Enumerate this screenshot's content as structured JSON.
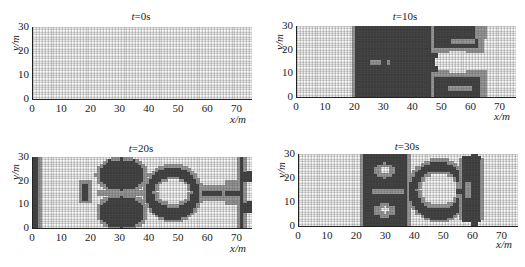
{
  "figure": {
    "colors": {
      "dense": "#3b3b3b",
      "boundary": "#9c9c9c",
      "empty": "#ffffff",
      "grid": "#555555",
      "axis": "#222222"
    }
  },
  "chart_data": [
    {
      "type": "heatmap",
      "title": "t=0s",
      "title_var": "t",
      "title_val": "=0s",
      "xlabel": "x/m",
      "ylabel": "y/m",
      "xlim": [
        0,
        75
      ],
      "ylim": [
        0,
        30
      ],
      "xticks": [
        0,
        10,
        20,
        30,
        40,
        50,
        60,
        70
      ],
      "yticks": [
        0,
        10,
        20,
        30
      ],
      "grid": true,
      "cell_size_m": 1,
      "regions": []
    },
    {
      "type": "heatmap",
      "title": "t=10s",
      "title_var": "t",
      "title_val": "=10s",
      "xlabel": "x/m",
      "ylabel": "y/m",
      "xlim": [
        0,
        75
      ],
      "ylim": [
        0,
        30
      ],
      "xticks": [
        0,
        10,
        20,
        30,
        40,
        50,
        60,
        70
      ],
      "yticks": [
        0,
        10,
        20,
        30
      ],
      "grid": true,
      "cell_size_m": 1,
      "regions": [
        {
          "shape": "rect",
          "x0": 19,
          "x1": 48,
          "y0": 0,
          "y1": 30,
          "level": "boundary"
        },
        {
          "shape": "rect",
          "x0": 20,
          "x1": 48,
          "y0": 0,
          "y1": 30,
          "level": "dense"
        },
        {
          "shape": "rect",
          "x0": 46,
          "x1": 64,
          "y0": 19,
          "y1": 30,
          "level": "boundary"
        },
        {
          "shape": "rect",
          "x0": 47,
          "x1": 62,
          "y0": 21,
          "y1": 30,
          "level": "dense"
        },
        {
          "shape": "rect",
          "x0": 46,
          "x1": 65,
          "y0": 0,
          "y1": 11,
          "level": "boundary"
        },
        {
          "shape": "rect",
          "x0": 47,
          "x1": 63,
          "y0": 0,
          "y1": 9,
          "level": "dense"
        },
        {
          "shape": "ellipse",
          "cx": 57,
          "cy": 24,
          "rx": 5,
          "ry": 1,
          "level": "boundary"
        },
        {
          "shape": "ellipse",
          "cx": 56,
          "cy": 4,
          "rx": 5,
          "ry": 1,
          "level": "boundary"
        },
        {
          "shape": "rect",
          "x0": 25,
          "x1": 29,
          "y0": 14,
          "y1": 16,
          "level": "boundary"
        },
        {
          "shape": "rect",
          "x0": 31,
          "x1": 32,
          "y0": 14,
          "y1": 16,
          "level": "boundary"
        },
        {
          "shape": "rect",
          "x0": 61,
          "x1": 65,
          "y0": 25,
          "y1": 30,
          "level": "boundary"
        },
        {
          "shape": "ellipse",
          "cx": 55,
          "cy": 15,
          "rx": 8,
          "ry": 5,
          "level": "empty"
        }
      ]
    },
    {
      "type": "heatmap",
      "title": "t=20s",
      "title_var": "t",
      "title_val": "=20s",
      "xlabel": "x/m",
      "ylabel": "y/m",
      "xlim": [
        0,
        75
      ],
      "ylim": [
        0,
        30
      ],
      "xticks": [
        0,
        10,
        20,
        30,
        40,
        50,
        60,
        70
      ],
      "yticks": [
        0,
        10,
        20,
        30
      ],
      "grid": true,
      "cell_size_m": 1,
      "regions": [
        {
          "shape": "rect",
          "x0": 0,
          "x1": 3,
          "y0": 0,
          "y1": 30,
          "level": "boundary"
        },
        {
          "shape": "rect",
          "x0": 0,
          "x1": 2,
          "y0": 0,
          "y1": 30,
          "level": "dense"
        },
        {
          "shape": "rect",
          "x0": 16,
          "x1": 20,
          "y0": 11,
          "y1": 20,
          "level": "boundary"
        },
        {
          "shape": "rect",
          "x0": 17,
          "x1": 19,
          "y0": 12,
          "y1": 19,
          "level": "dense"
        },
        {
          "shape": "ellipse",
          "cx": 30.5,
          "cy": 22.5,
          "rx": 9,
          "ry": 7.5,
          "level": "boundary"
        },
        {
          "shape": "ellipse",
          "cx": 30.5,
          "cy": 23,
          "rx": 8,
          "ry": 6.5,
          "level": "dense"
        },
        {
          "shape": "ellipse",
          "cx": 30.5,
          "cy": 7,
          "rx": 9,
          "ry": 7.5,
          "level": "boundary"
        },
        {
          "shape": "ellipse",
          "cx": 30.5,
          "cy": 7,
          "rx": 8,
          "ry": 6.5,
          "level": "dense"
        },
        {
          "shape": "rect",
          "x0": 22,
          "x1": 38,
          "y0": 14,
          "y1": 16,
          "level": "boundary"
        },
        {
          "shape": "ellipse",
          "cx": 48,
          "cy": 15,
          "rx": 10,
          "ry": 12,
          "level": "boundary"
        },
        {
          "shape": "ellipse",
          "cx": 48,
          "cy": 15,
          "rx": 9,
          "ry": 11,
          "level": "dense"
        },
        {
          "shape": "ellipse",
          "cx": 48,
          "cy": 15.5,
          "rx": 6.5,
          "ry": 6.5,
          "level": "boundary"
        },
        {
          "shape": "ellipse",
          "cx": 48,
          "cy": 15.5,
          "rx": 5.5,
          "ry": 5.5,
          "level": "empty"
        },
        {
          "shape": "rect",
          "x0": 58,
          "x1": 66,
          "y0": 12,
          "y1": 18,
          "level": "boundary"
        },
        {
          "shape": "rect",
          "x0": 58,
          "x1": 65,
          "y0": 14,
          "y1": 16,
          "level": "dense"
        },
        {
          "shape": "rect",
          "x0": 66,
          "x1": 71,
          "y0": 10,
          "y1": 20,
          "level": "boundary"
        },
        {
          "shape": "rect",
          "x0": 70,
          "x1": 73,
          "y0": 0,
          "y1": 30,
          "level": "boundary"
        },
        {
          "shape": "rect",
          "x0": 71,
          "x1": 72,
          "y0": 0,
          "y1": 30,
          "level": "dense"
        },
        {
          "shape": "rect",
          "x0": 72,
          "x1": 75,
          "y0": 20,
          "y1": 24,
          "level": "dense"
        },
        {
          "shape": "rect",
          "x0": 72,
          "x1": 75,
          "y0": 7,
          "y1": 11,
          "level": "dense"
        },
        {
          "shape": "rect",
          "x0": 66,
          "x1": 71,
          "y0": 14,
          "y1": 16,
          "level": "dense"
        }
      ]
    },
    {
      "type": "heatmap",
      "title": "t=30s",
      "title_var": "t",
      "title_val": "=30s",
      "xlabel": "x/m",
      "ylabel": "y/m",
      "xlim": [
        0,
        75
      ],
      "ylim": [
        0,
        30
      ],
      "xticks": [
        0,
        10,
        20,
        30,
        40,
        50,
        60,
        70
      ],
      "yticks": [
        0,
        10,
        20,
        30
      ],
      "grid": true,
      "cell_size_m": 1,
      "regions": [
        {
          "shape": "rect",
          "x0": 21,
          "x1": 38,
          "y0": 0,
          "y1": 30,
          "level": "boundary"
        },
        {
          "shape": "rect",
          "x0": 22,
          "x1": 37,
          "y0": 0,
          "y1": 30,
          "level": "dense"
        },
        {
          "shape": "ellipse",
          "cx": 29.5,
          "cy": 23.5,
          "rx": 3.5,
          "ry": 3,
          "level": "boundary"
        },
        {
          "shape": "ellipse",
          "cx": 29.5,
          "cy": 23.5,
          "rx": 2,
          "ry": 1.5,
          "level": "empty"
        },
        {
          "shape": "ellipse",
          "cx": 29.5,
          "cy": 7,
          "rx": 3.5,
          "ry": 3,
          "level": "boundary"
        },
        {
          "shape": "ellipse",
          "cx": 29.5,
          "cy": 7,
          "rx": 2,
          "ry": 1.5,
          "level": "empty"
        },
        {
          "shape": "rect",
          "x0": 25,
          "x1": 36,
          "y0": 14,
          "y1": 16,
          "level": "boundary"
        },
        {
          "shape": "ellipse",
          "cx": 48,
          "cy": 15,
          "rx": 11,
          "ry": 13,
          "level": "boundary"
        },
        {
          "shape": "ellipse",
          "cx": 48,
          "cy": 15,
          "rx": 10,
          "ry": 12,
          "level": "dense"
        },
        {
          "shape": "ellipse",
          "cx": 48,
          "cy": 15.5,
          "rx": 7.5,
          "ry": 8,
          "level": "boundary"
        },
        {
          "shape": "ellipse",
          "cx": 48,
          "cy": 15.5,
          "rx": 6.5,
          "ry": 7,
          "level": "empty"
        },
        {
          "shape": "rect",
          "x0": 55,
          "x1": 63,
          "y0": 3,
          "y1": 28,
          "level": "boundary"
        },
        {
          "shape": "rect",
          "x0": 56,
          "x1": 62,
          "y0": 2,
          "y1": 29,
          "level": "dense"
        },
        {
          "shape": "rect",
          "x0": 59,
          "x1": 61,
          "y0": 0,
          "y1": 30,
          "level": "dense"
        },
        {
          "shape": "rect",
          "x0": 57,
          "x1": 59,
          "y0": 12,
          "y1": 19,
          "level": "boundary"
        },
        {
          "shape": "rect",
          "x0": 54,
          "x1": 56,
          "y0": 14,
          "y1": 16,
          "level": "dense"
        }
      ]
    }
  ]
}
